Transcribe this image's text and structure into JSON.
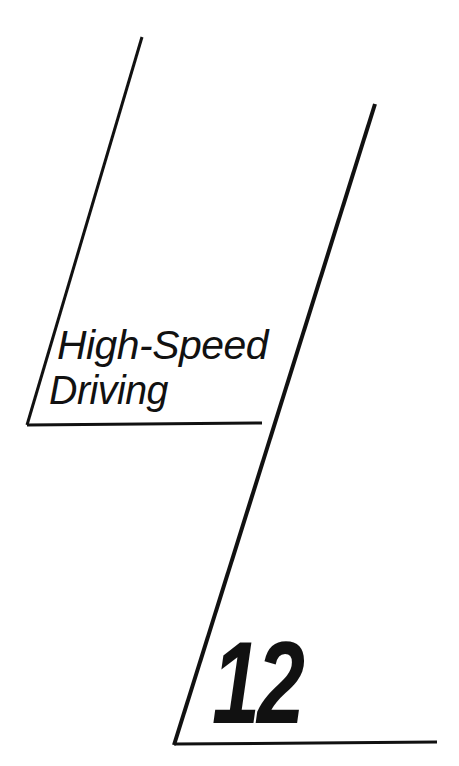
{
  "page": {
    "kind": "chapter-opener",
    "background_color": "#ffffff",
    "ink_color": "#111111",
    "width": 459,
    "height": 766
  },
  "title": {
    "line1": "High-Speed",
    "line2": "Driving",
    "full": "High-Speed Driving"
  },
  "chapter": {
    "number": "12"
  },
  "rules": {
    "left_diagonal": {
      "x1": 142,
      "y1": 37,
      "x2": 27,
      "y2": 425,
      "width": 3
    },
    "right_diagonal": {
      "x1": 375,
      "y1": 104,
      "x2": 174,
      "y2": 745,
      "width": 4
    },
    "title_underline": {
      "x1": 27,
      "y1": 425,
      "x2": 262,
      "y2": 423,
      "width": 3
    },
    "bottom_rule": {
      "x1": 174,
      "y1": 744,
      "x2": 437,
      "y2": 742,
      "width": 3
    }
  }
}
